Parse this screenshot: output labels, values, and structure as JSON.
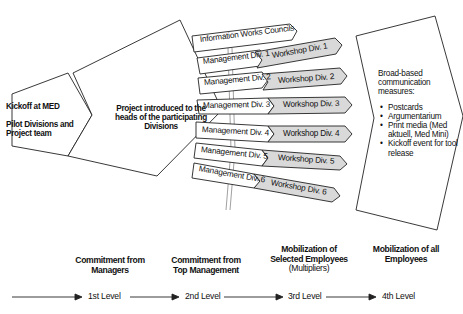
{
  "kickoff": {
    "line1": "Kickoff at MED",
    "line2": "Pilot Divisions and Project team"
  },
  "project": {
    "text": "Project introduced to the heads of the participating Divisions"
  },
  "info_councils": "Information Works Councils",
  "management": [
    "Management Div. 1",
    "Management Div. 2",
    "Management Div. 3",
    "Management Div. 4",
    "Management Div. 5",
    "Management Div. 6"
  ],
  "workshops": [
    "Workshop Div. 1",
    "Workshop Div. 2",
    "Workshop Div. 3",
    "Workshop Div. 4",
    "Workshop Div. 5",
    "Workshop Div. 6"
  ],
  "broad": {
    "heading": "Broad-based communication measures:",
    "items": [
      "Postcards",
      "Argumentarium",
      "Print media (Med aktuell, Med Mini)",
      "Kickoff event for tool release"
    ]
  },
  "stages": [
    {
      "title": "Commitment from Managers",
      "sub": ""
    },
    {
      "title": "Commitment from Top Management",
      "sub": ""
    },
    {
      "title": "Mobilization of Selected Employees",
      "sub": "(Multipliers)"
    },
    {
      "title": "Mobilization of all Employees",
      "sub": ""
    }
  ],
  "levels": [
    "1st Level",
    "2nd Level",
    "3rd Level",
    "4th Level"
  ],
  "colors": {
    "stroke": "#222222",
    "workshop_fill": "#d9d9d9",
    "box_fill": "#ffffff"
  }
}
